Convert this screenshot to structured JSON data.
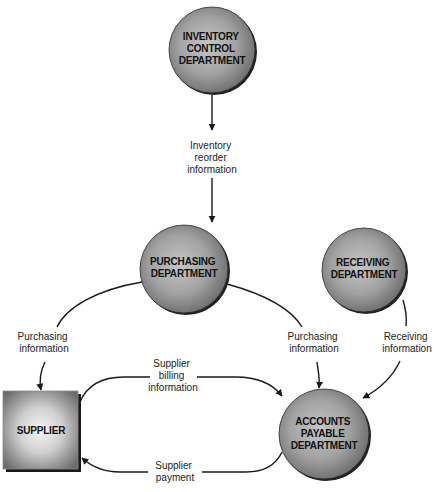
{
  "diagram": {
    "type": "data flow diagram",
    "nodes": [
      {
        "id": "inventory",
        "shape": "circle",
        "lines": [
          "INVENTORY",
          "CONTROL",
          "DEPARTMENT"
        ]
      },
      {
        "id": "purchasing",
        "shape": "circle",
        "lines": [
          "PURCHASING",
          "DEPARTMENT"
        ]
      },
      {
        "id": "receiving",
        "shape": "circle",
        "lines": [
          "RECEIVING",
          "DEPARTMENT"
        ]
      },
      {
        "id": "accounts_payable",
        "shape": "circle",
        "lines": [
          "ACCOUNTS",
          "PAYABLE",
          "DEPARTMENT"
        ]
      },
      {
        "id": "supplier",
        "shape": "square",
        "lines": [
          "SUPPLIER"
        ]
      }
    ],
    "edges": [
      {
        "from": "inventory",
        "to": "purchasing",
        "lines": [
          "Inventory",
          "reorder",
          "information"
        ]
      },
      {
        "from": "purchasing",
        "to": "supplier",
        "lines": [
          "Purchasing",
          "information"
        ]
      },
      {
        "from": "purchasing",
        "to": "accounts_payable",
        "lines": [
          "Purchasing",
          "information"
        ]
      },
      {
        "from": "receiving",
        "to": "accounts_payable",
        "lines": [
          "Receiving",
          "information"
        ]
      },
      {
        "from": "supplier",
        "to": "accounts_payable",
        "lines": [
          "Supplier",
          "billing",
          "information"
        ]
      },
      {
        "from": "accounts_payable",
        "to": "supplier",
        "lines": [
          "Supplier",
          "payment"
        ]
      }
    ]
  },
  "colors": {
    "node_fill_light": "#c4c4c4",
    "node_fill_dark": "#6e6e6e",
    "node_outline": "#111111",
    "edge": "#1a1a1a",
    "text": "#111111"
  }
}
